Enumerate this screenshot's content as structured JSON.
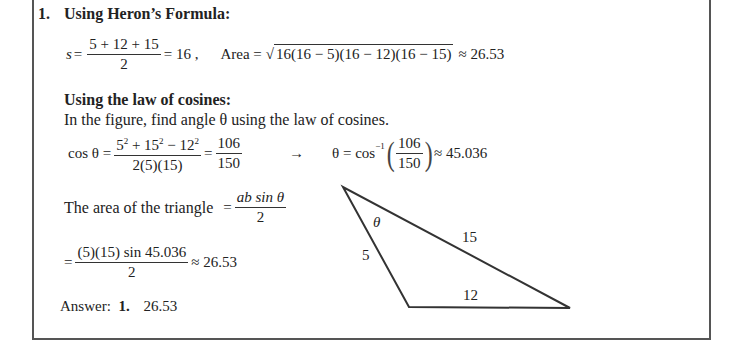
{
  "problem": {
    "number": "1.",
    "heron": {
      "heading": "Using Heron’s Formula:",
      "s_lhs": "s",
      "s_num": "5 + 12 + 15",
      "s_den": "2",
      "s_result": "= 16 ,",
      "area_label": "Area =",
      "area_radical": "16(16 − 5)(16 − 12)(16 − 15)",
      "area_result": "≈ 26.53"
    },
    "cosines": {
      "heading": "Using the law of cosines:",
      "intro": "In the figure, find angle θ using the law of cosines.",
      "cos_lhs": "cos θ =",
      "cos_num_html": "5² + 15² − 12²",
      "cos_den": "2(5)(15)",
      "eq": "=",
      "ratio_num": "106",
      "ratio_den": "150",
      "arrow": "→",
      "theta_lhs": "θ = cos",
      "theta_sup": "−1",
      "theta_result": "≈ 45.036",
      "area_text": "The area of the triangle",
      "area_eq": "=",
      "area_formula_num": "ab sin θ",
      "area_formula_den": "2",
      "calc_eq": "=",
      "calc_num": "(5)(15) sin 45.036",
      "calc_den": "2",
      "calc_result": "≈ 26.53"
    },
    "answer": {
      "label": "Answer:",
      "number": "1.",
      "value": "26.53"
    },
    "figure": {
      "angle_label": "θ",
      "side_a": "5",
      "side_b": "15",
      "side_c": "12"
    }
  }
}
